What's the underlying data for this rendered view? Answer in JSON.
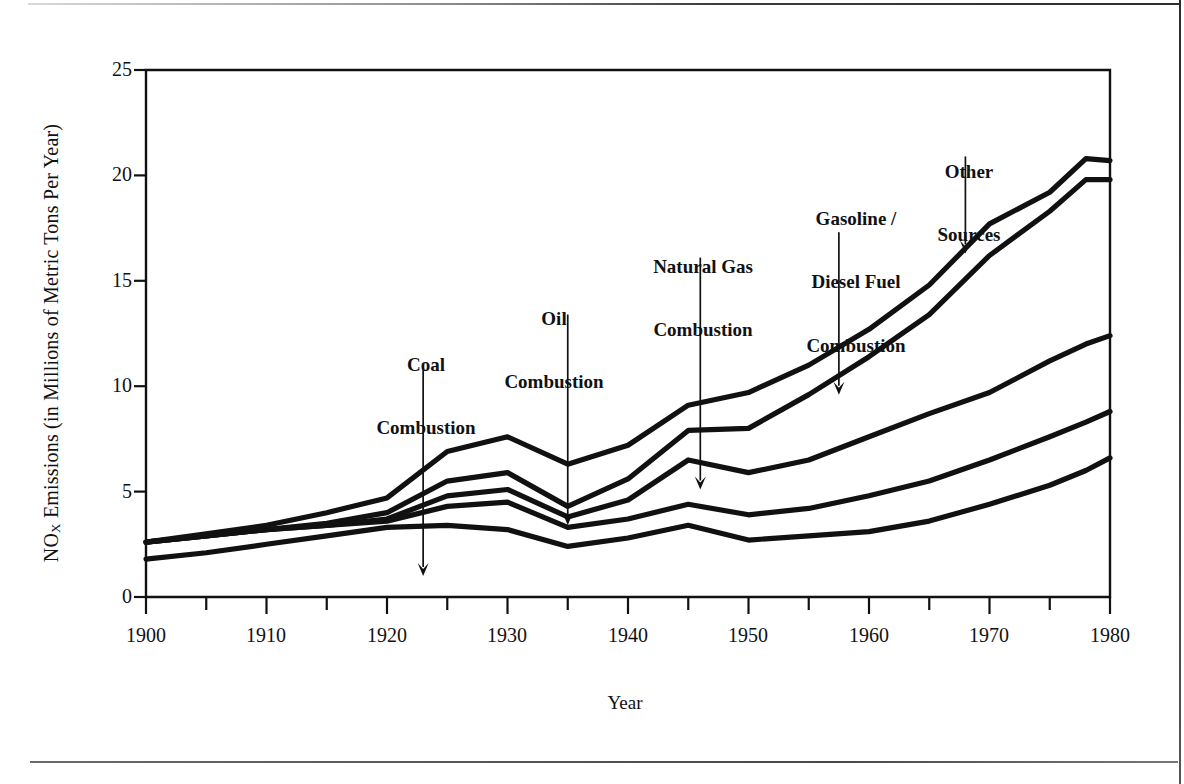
{
  "figure": {
    "ylabel_main": "NO",
    "ylabel_sub": "X",
    "ylabel_rest": " Emissions (in Millions of Metric Tons Per Year)",
    "xlabel": "Year"
  },
  "chart_data": {
    "type": "line",
    "title": "",
    "xlabel": "Year",
    "ylabel": "NOX Emissions (in Millions of Metric Tons Per Year)",
    "xlim": [
      1900,
      1980
    ],
    "ylim": [
      0,
      25
    ],
    "xticks": [
      1900,
      1910,
      1920,
      1930,
      1940,
      1950,
      1960,
      1970,
      1980
    ],
    "xticks_minor": [
      1905,
      1915,
      1925,
      1935,
      1945,
      1955,
      1965,
      1975
    ],
    "yticks": [
      0,
      5,
      10,
      15,
      20,
      25
    ],
    "grid": false,
    "legend": "annotations-with-arrows",
    "note": "Cumulative stacked boundary lines; each curve is the running total of sources below it.",
    "x": [
      1900,
      1905,
      1910,
      1915,
      1920,
      1925,
      1930,
      1935,
      1940,
      1945,
      1950,
      1955,
      1960,
      1965,
      1970,
      1975,
      1978,
      1980
    ],
    "series": [
      {
        "name": "Coal Combustion",
        "label": "Coal\nCombustion",
        "cumulative_values": [
          1.8,
          2.1,
          2.5,
          2.9,
          3.3,
          3.4,
          3.2,
          2.4,
          2.8,
          3.4,
          2.7,
          2.9,
          3.1,
          3.6,
          4.4,
          5.3,
          6.0,
          6.6
        ]
      },
      {
        "name": "Oil Combustion",
        "label": "Oil\nCombustion",
        "cumulative_values": [
          2.6,
          2.9,
          3.2,
          3.4,
          3.6,
          4.3,
          4.5,
          3.3,
          3.7,
          4.4,
          3.9,
          4.2,
          4.8,
          5.5,
          6.5,
          7.6,
          8.3,
          8.8
        ]
      },
      {
        "name": "Natural Gas Combustion",
        "label": "Natural Gas\nCombustion",
        "cumulative_values": [
          2.6,
          2.9,
          3.2,
          3.4,
          3.7,
          4.8,
          5.1,
          3.8,
          4.6,
          6.5,
          5.9,
          6.5,
          7.6,
          8.7,
          9.7,
          11.2,
          12.0,
          12.4
        ]
      },
      {
        "name": "Gasoline / Diesel Fuel Combustion",
        "label": "Gasoline /\nDiesel Fuel\nCombustion",
        "cumulative_values": [
          2.6,
          2.9,
          3.2,
          3.5,
          4.0,
          5.5,
          5.9,
          4.3,
          5.6,
          7.9,
          8.0,
          9.6,
          11.4,
          13.4,
          16.2,
          18.3,
          19.8,
          19.8
        ]
      },
      {
        "name": "Other Sources",
        "label": "Other\nSources",
        "cumulative_values": [
          2.6,
          3.0,
          3.4,
          4.0,
          4.7,
          6.9,
          7.6,
          6.3,
          7.2,
          9.1,
          9.7,
          11.0,
          12.7,
          14.8,
          17.7,
          19.2,
          20.8,
          20.7
        ]
      }
    ],
    "annotations": [
      {
        "label": "Coal\nCombustion",
        "text_x": 1923,
        "text_y_value": 12.0,
        "arrow_from_value": 10.9,
        "arrow_to_value": 1.0
      },
      {
        "label": "Oil\nCombustion",
        "text_x": 1935,
        "text_y_value": 14.6,
        "arrow_from_value": 13.4,
        "arrow_to_value": 3.4
      },
      {
        "label": "Natural Gas\nCombustion",
        "text_x": 1946,
        "text_y_value": 17.4,
        "arrow_from_value": 16.1,
        "arrow_to_value": 5.1
      },
      {
        "label": "Gasoline /\nDiesel Fuel\nCombustion",
        "text_x": 1957.5,
        "text_y_value": 19.5,
        "arrow_from_value": 17.3,
        "arrow_to_value": 9.6
      },
      {
        "label": "Other\nSources",
        "text_x": 1968,
        "text_y_value": 22.1,
        "arrow_from_value": 20.9,
        "arrow_to_value": 16.3
      }
    ]
  },
  "axis": {
    "y_tick_labels": [
      "25",
      "20",
      "15",
      "10",
      "5",
      "0"
    ],
    "x_tick_labels": [
      "1900",
      "1910",
      "1920",
      "1930",
      "1940",
      "1950",
      "1960",
      "1970",
      "1980"
    ]
  },
  "annotation_labels": {
    "coal": [
      "Coal",
      "Combustion"
    ],
    "oil": [
      "Oil",
      "Combustion"
    ],
    "gas": [
      "Natural Gas",
      "Combustion"
    ],
    "fuel": [
      "Gasoline /",
      "Diesel Fuel",
      "Combustion"
    ],
    "other": [
      "Other",
      "Sources"
    ]
  },
  "colors": {
    "ink": "#111111",
    "paper": "#ffffff",
    "rule": "#4a4a4a"
  }
}
